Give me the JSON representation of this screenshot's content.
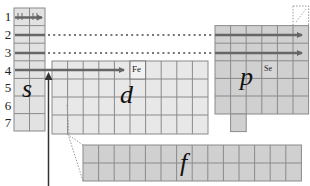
{
  "diagram": {
    "periods": [
      "1",
      "2",
      "3",
      "4",
      "5",
      "6",
      "7"
    ],
    "blocks": {
      "s": {
        "letter": "s",
        "columns": 2,
        "rows": 7
      },
      "p": {
        "letter": "p",
        "columns": 6,
        "rows": 5
      },
      "d": {
        "letter": "d",
        "columns": 10,
        "rows": 4
      },
      "f": {
        "letter": "f",
        "columns": 14,
        "rows": 2
      }
    },
    "highlighted_elements": [
      {
        "symbol": "Fe",
        "block": "d",
        "period": "4"
      },
      {
        "symbol": "Se",
        "block": "p",
        "period": "4"
      }
    ],
    "row1_cells": [
      "H",
      "He"
    ],
    "colors": {
      "s_block": "#e2e2e2",
      "d_block": "#e8e8e8",
      "p_block": "#d0d0d0",
      "f_block": "#d0d0d0",
      "grid_line": "#8a8a8a",
      "arrow": "#666666",
      "dotted": "#777777"
    }
  }
}
